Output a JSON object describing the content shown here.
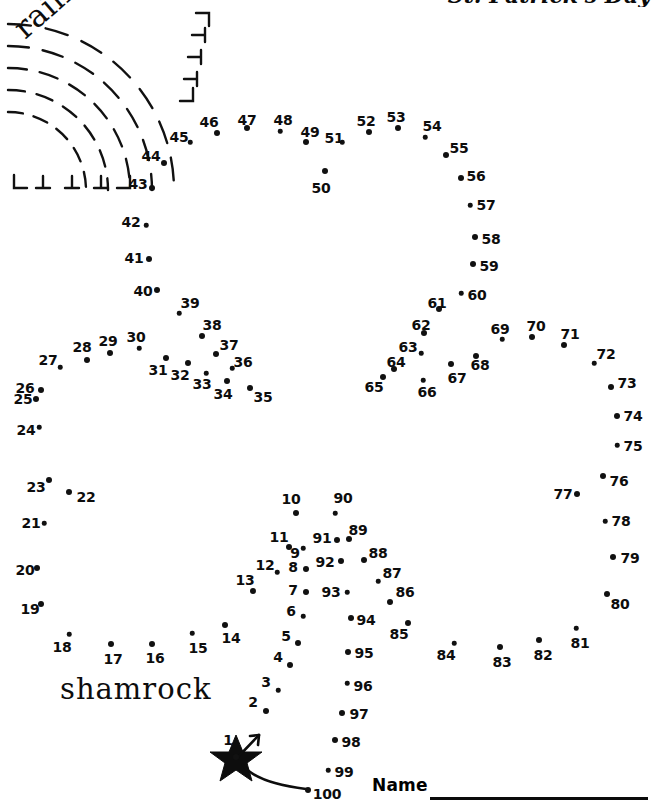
{
  "page": {
    "title_partial": "St. Patrick's Day",
    "width": 651,
    "height": 805,
    "background_color": "#ffffff",
    "ink_color": "#0d0d0d"
  },
  "labels": {
    "rainbow": "rainbow",
    "shamrock": "shamrock",
    "name": "Name"
  },
  "start_marker": {
    "name": "star-start-marker",
    "number": "1",
    "x": 236,
    "y": 757,
    "arrow": "up-right"
  },
  "puzzle": {
    "type": "connect-the-dots",
    "dot_count": 100,
    "first_dot": "1",
    "last_dot": "100",
    "dots": [
      {
        "n": "1",
        "x": 236,
        "y": 757,
        "lx": 228,
        "ly": 740
      },
      {
        "n": "2",
        "x": 266,
        "y": 711,
        "lx": 253,
        "ly": 702
      },
      {
        "n": "3",
        "x": 278,
        "y": 690,
        "lx": 266,
        "ly": 682
      },
      {
        "n": "4",
        "x": 290,
        "y": 665,
        "lx": 278,
        "ly": 657
      },
      {
        "n": "5",
        "x": 298,
        "y": 643,
        "lx": 286,
        "ly": 636
      },
      {
        "n": "6",
        "x": 303,
        "y": 616,
        "lx": 291,
        "ly": 611
      },
      {
        "n": "7",
        "x": 306,
        "y": 592,
        "lx": 293,
        "ly": 590
      },
      {
        "n": "8",
        "x": 306,
        "y": 569,
        "lx": 293,
        "ly": 567
      },
      {
        "n": "9",
        "x": 303,
        "y": 548,
        "lx": 295,
        "ly": 553
      },
      {
        "n": "10",
        "x": 296,
        "y": 513,
        "lx": 291,
        "ly": 499
      },
      {
        "n": "11",
        "x": 289,
        "y": 547,
        "lx": 279,
        "ly": 537
      },
      {
        "n": "12",
        "x": 277,
        "y": 572,
        "lx": 265,
        "ly": 565
      },
      {
        "n": "13",
        "x": 253,
        "y": 591,
        "lx": 245,
        "ly": 580
      },
      {
        "n": "14",
        "x": 225,
        "y": 625,
        "lx": 231,
        "ly": 638
      },
      {
        "n": "15",
        "x": 192,
        "y": 633,
        "lx": 198,
        "ly": 648
      },
      {
        "n": "16",
        "x": 152,
        "y": 644,
        "lx": 155,
        "ly": 658
      },
      {
        "n": "17",
        "x": 111,
        "y": 644,
        "lx": 113,
        "ly": 659
      },
      {
        "n": "18",
        "x": 69,
        "y": 634,
        "lx": 62,
        "ly": 647
      },
      {
        "n": "19",
        "x": 41,
        "y": 604,
        "lx": 30,
        "ly": 609
      },
      {
        "n": "20",
        "x": 37,
        "y": 568,
        "lx": 25,
        "ly": 570
      },
      {
        "n": "21",
        "x": 44,
        "y": 523,
        "lx": 31,
        "ly": 523
      },
      {
        "n": "22",
        "x": 69,
        "y": 492,
        "lx": 86,
        "ly": 497
      },
      {
        "n": "23",
        "x": 49,
        "y": 480,
        "lx": 36,
        "ly": 487
      },
      {
        "n": "24",
        "x": 39,
        "y": 427,
        "lx": 26,
        "ly": 430
      },
      {
        "n": "25",
        "x": 36,
        "y": 399,
        "lx": 23,
        "ly": 399
      },
      {
        "n": "26",
        "x": 41,
        "y": 390,
        "lx": 25,
        "ly": 388
      },
      {
        "n": "27",
        "x": 60,
        "y": 367,
        "lx": 48,
        "ly": 360
      },
      {
        "n": "28",
        "x": 87,
        "y": 360,
        "lx": 82,
        "ly": 347
      },
      {
        "n": "29",
        "x": 110,
        "y": 353,
        "lx": 108,
        "ly": 341
      },
      {
        "n": "30",
        "x": 139,
        "y": 348,
        "lx": 136,
        "ly": 337
      },
      {
        "n": "31",
        "x": 166,
        "y": 358,
        "lx": 158,
        "ly": 370
      },
      {
        "n": "32",
        "x": 188,
        "y": 363,
        "lx": 180,
        "ly": 375
      },
      {
        "n": "33",
        "x": 206,
        "y": 373,
        "lx": 202,
        "ly": 384
      },
      {
        "n": "34",
        "x": 227,
        "y": 381,
        "lx": 223,
        "ly": 394
      },
      {
        "n": "35",
        "x": 250,
        "y": 388,
        "lx": 263,
        "ly": 397
      },
      {
        "n": "36",
        "x": 232,
        "y": 368,
        "lx": 243,
        "ly": 362
      },
      {
        "n": "37",
        "x": 216,
        "y": 354,
        "lx": 229,
        "ly": 345
      },
      {
        "n": "38",
        "x": 202,
        "y": 336,
        "lx": 212,
        "ly": 325
      },
      {
        "n": "39",
        "x": 179,
        "y": 313,
        "lx": 190,
        "ly": 303
      },
      {
        "n": "40",
        "x": 157,
        "y": 290,
        "lx": 143,
        "ly": 291
      },
      {
        "n": "41",
        "x": 149,
        "y": 259,
        "lx": 134,
        "ly": 258
      },
      {
        "n": "42",
        "x": 146,
        "y": 225,
        "lx": 131,
        "ly": 222
      },
      {
        "n": "43",
        "x": 152,
        "y": 188,
        "lx": 138,
        "ly": 184
      },
      {
        "n": "44",
        "x": 164,
        "y": 163,
        "lx": 151,
        "ly": 156
      },
      {
        "n": "45",
        "x": 190,
        "y": 142,
        "lx": 179,
        "ly": 137
      },
      {
        "n": "46",
        "x": 217,
        "y": 133,
        "lx": 209,
        "ly": 122
      },
      {
        "n": "47",
        "x": 247,
        "y": 128,
        "lx": 247,
        "ly": 120
      },
      {
        "n": "48",
        "x": 280,
        "y": 131,
        "lx": 283,
        "ly": 120
      },
      {
        "n": "49",
        "x": 306,
        "y": 142,
        "lx": 310,
        "ly": 132
      },
      {
        "n": "50",
        "x": 325,
        "y": 171,
        "lx": 321,
        "ly": 188
      },
      {
        "n": "51",
        "x": 342,
        "y": 142,
        "lx": 334,
        "ly": 138
      },
      {
        "n": "52",
        "x": 369,
        "y": 132,
        "lx": 366,
        "ly": 121
      },
      {
        "n": "53",
        "x": 398,
        "y": 128,
        "lx": 396,
        "ly": 117
      },
      {
        "n": "54",
        "x": 425,
        "y": 137,
        "lx": 432,
        "ly": 126
      },
      {
        "n": "55",
        "x": 446,
        "y": 155,
        "lx": 459,
        "ly": 148
      },
      {
        "n": "56",
        "x": 461,
        "y": 178,
        "lx": 476,
        "ly": 176
      },
      {
        "n": "57",
        "x": 470,
        "y": 205,
        "lx": 486,
        "ly": 205
      },
      {
        "n": "58",
        "x": 475,
        "y": 237,
        "lx": 491,
        "ly": 239
      },
      {
        "n": "59",
        "x": 473,
        "y": 264,
        "lx": 489,
        "ly": 266
      },
      {
        "n": "60",
        "x": 461,
        "y": 293,
        "lx": 477,
        "ly": 295
      },
      {
        "n": "61",
        "x": 439,
        "y": 309,
        "lx": 437,
        "ly": 303
      },
      {
        "n": "62",
        "x": 424,
        "y": 333,
        "lx": 421,
        "ly": 325
      },
      {
        "n": "63",
        "x": 421,
        "y": 353,
        "lx": 408,
        "ly": 347
      },
      {
        "n": "64",
        "x": 394,
        "y": 369,
        "lx": 396,
        "ly": 362
      },
      {
        "n": "65",
        "x": 383,
        "y": 377,
        "lx": 374,
        "ly": 387
      },
      {
        "n": "66",
        "x": 423,
        "y": 380,
        "lx": 427,
        "ly": 392
      },
      {
        "n": "67",
        "x": 451,
        "y": 364,
        "lx": 457,
        "ly": 378
      },
      {
        "n": "68",
        "x": 476,
        "y": 356,
        "lx": 480,
        "ly": 365
      },
      {
        "n": "69",
        "x": 502,
        "y": 339,
        "lx": 500,
        "ly": 329
      },
      {
        "n": "70",
        "x": 532,
        "y": 337,
        "lx": 536,
        "ly": 326
      },
      {
        "n": "71",
        "x": 564,
        "y": 345,
        "lx": 570,
        "ly": 334
      },
      {
        "n": "72",
        "x": 594,
        "y": 363,
        "lx": 606,
        "ly": 354
      },
      {
        "n": "73",
        "x": 611,
        "y": 387,
        "lx": 627,
        "ly": 383
      },
      {
        "n": "74",
        "x": 617,
        "y": 416,
        "lx": 633,
        "ly": 416
      },
      {
        "n": "75",
        "x": 617,
        "y": 445,
        "lx": 633,
        "ly": 446
      },
      {
        "n": "76",
        "x": 603,
        "y": 476,
        "lx": 619,
        "ly": 481
      },
      {
        "n": "77",
        "x": 577,
        "y": 494,
        "lx": 563,
        "ly": 494
      },
      {
        "n": "78",
        "x": 605,
        "y": 521,
        "lx": 621,
        "ly": 521
      },
      {
        "n": "79",
        "x": 613,
        "y": 557,
        "lx": 630,
        "ly": 558
      },
      {
        "n": "80",
        "x": 607,
        "y": 594,
        "lx": 620,
        "ly": 604
      },
      {
        "n": "81",
        "x": 576,
        "y": 628,
        "lx": 580,
        "ly": 643
      },
      {
        "n": "82",
        "x": 539,
        "y": 640,
        "lx": 543,
        "ly": 655
      },
      {
        "n": "83",
        "x": 500,
        "y": 647,
        "lx": 502,
        "ly": 662
      },
      {
        "n": "84",
        "x": 454,
        "y": 643,
        "lx": 446,
        "ly": 655
      },
      {
        "n": "85",
        "x": 408,
        "y": 623,
        "lx": 399,
        "ly": 634
      },
      {
        "n": "86",
        "x": 390,
        "y": 602,
        "lx": 405,
        "ly": 592
      },
      {
        "n": "87",
        "x": 378,
        "y": 581,
        "lx": 392,
        "ly": 573
      },
      {
        "n": "88",
        "x": 364,
        "y": 560,
        "lx": 378,
        "ly": 553
      },
      {
        "n": "89",
        "x": 349,
        "y": 539,
        "lx": 358,
        "ly": 530
      },
      {
        "n": "90",
        "x": 335,
        "y": 513,
        "lx": 343,
        "ly": 498
      },
      {
        "n": "91",
        "x": 337,
        "y": 540,
        "lx": 322,
        "ly": 538
      },
      {
        "n": "92",
        "x": 341,
        "y": 561,
        "lx": 325,
        "ly": 562
      },
      {
        "n": "93",
        "x": 347,
        "y": 592,
        "lx": 331,
        "ly": 592
      },
      {
        "n": "94",
        "x": 351,
        "y": 618,
        "lx": 366,
        "ly": 620
      },
      {
        "n": "95",
        "x": 348,
        "y": 652,
        "lx": 364,
        "ly": 653
      },
      {
        "n": "96",
        "x": 347,
        "y": 683,
        "lx": 363,
        "ly": 686
      },
      {
        "n": "97",
        "x": 342,
        "y": 713,
        "lx": 359,
        "ly": 714
      },
      {
        "n": "98",
        "x": 335,
        "y": 740,
        "lx": 351,
        "ly": 742
      },
      {
        "n": "99",
        "x": 328,
        "y": 770,
        "lx": 344,
        "ly": 772
      },
      {
        "n": "100",
        "x": 308,
        "y": 790,
        "lx": 327,
        "ly": 794
      }
    ]
  },
  "rainbow_art": {
    "name": "rainbow-dashed-arcs",
    "arc_count": 5,
    "style": "dashed",
    "center_x": 8,
    "center_y": 190,
    "radii": [
      78,
      100,
      122,
      144,
      166
    ]
  }
}
